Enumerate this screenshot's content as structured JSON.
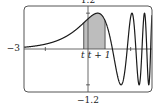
{
  "chart_data": {
    "type": "line",
    "title": "",
    "function": "sin(e^x)",
    "xlim": [
      -3,
      3
    ],
    "ylim": [
      -1.2,
      1.2
    ],
    "x_ticks": [
      -2,
      2
    ],
    "y_ticks": [
      -1,
      1
    ],
    "tick_labels": {
      "xmin": "−3",
      "ymin": "−1.2",
      "ymax": "1.2"
    },
    "shaded_region": {
      "from": -0.2,
      "to": 0.8,
      "from_label": "t",
      "to_label": "t + 1",
      "color": "#bdbdbd"
    },
    "grid": false,
    "curve_color": "#1a1a1a",
    "frame_color": "#555555"
  }
}
